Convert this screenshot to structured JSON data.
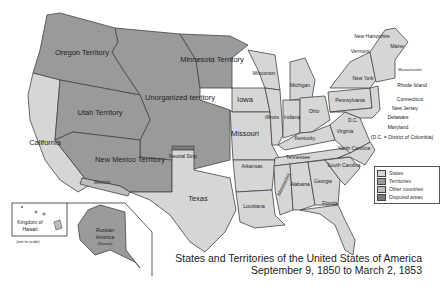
{
  "title": {
    "line1": "States and Territories of the United States of America",
    "line2": "September 9, 1850 to March 2, 1853"
  },
  "colors": {
    "state": "#d6d6d6",
    "territory": "#9a9a9a",
    "other_country": "#bdbdbd",
    "disputed": "#7a7a7a",
    "border": "#444444",
    "water": "#ffffff"
  },
  "legend": [
    {
      "label": "States",
      "color": "#d6d6d6"
    },
    {
      "label": "Territories",
      "color": "#9a9a9a"
    },
    {
      "label": "Other countries",
      "color": "#bdbdbd"
    },
    {
      "label": "Disputed areas",
      "color": "#7a7a7a"
    }
  ],
  "territories": {
    "oregon": "Oregon Territory",
    "utah": "Utah Territory",
    "new_mexico": "New Mexico Territory",
    "minnesota": "Minnesota Territory",
    "unorganized": "Unorganized territory",
    "neutral_strip": "Neutral Strip"
  },
  "states": {
    "california": "California",
    "texas": "Texas",
    "iowa": "Iowa",
    "missouri": "Missouri",
    "arkansas": "Arkansas",
    "louisiana": "Louisiana",
    "wisconsin": "Wisconsin",
    "illinois": "Illinois",
    "indiana": "Indiana",
    "michigan": "Michigan",
    "ohio": "Ohio",
    "kentucky": "Kentucky",
    "tennessee": "Tennessee",
    "mississippi": "Mississippi",
    "alabama": "Alabama",
    "georgia": "Georgia",
    "florida": "Florida",
    "south_carolina": "South Carolina",
    "north_carolina": "North Carolina",
    "virginia": "Virginia",
    "pennsylvania": "Pennsylvania",
    "new_york": "New York",
    "vermont": "Vermont",
    "new_hampshire": "New Hampshire",
    "maine": "Maine",
    "massachusetts": "Massachusetts",
    "rhode_island": "Rhode Island",
    "connecticut": "Connecticut",
    "new_jersey": "New Jersey",
    "delaware": "Delaware",
    "maryland": "Maryland",
    "dc_short": "D.C.",
    "dc_note": "(D.C. = District of Columbia)"
  },
  "other": {
    "mexico": "Mexico",
    "hawaii_line1": "Kingdom of",
    "hawaii_line2": "Hawaii",
    "hawaii_note": "(not to scale)",
    "russian_line1": "Russian",
    "russian_line2": "America",
    "russian_note": "(Russia)"
  }
}
